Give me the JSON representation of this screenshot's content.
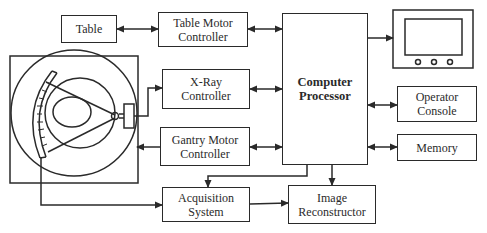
{
  "diagram": {
    "type": "CT scanner system block diagram",
    "blocks": {
      "table": {
        "label": "Table"
      },
      "table_motor": {
        "label": "Table Motor\nController"
      },
      "xray": {
        "label": "X-Ray\nController"
      },
      "gantry_motor": {
        "label": "Gantry Motor\nController"
      },
      "computer": {
        "label": "Computer\nProcessor"
      },
      "operator": {
        "label": "Operator\nConsole"
      },
      "memory": {
        "label": "Memory"
      },
      "acquisition": {
        "label": "Acquisition\nSystem"
      },
      "reconstructor": {
        "label": "Image\nReconstructor"
      }
    },
    "icons": {
      "gantry": "ct-gantry-icon",
      "monitor": "display-monitor-icon"
    },
    "connections": [
      {
        "from": "Table",
        "to": "Table Motor Controller",
        "type": "bidirectional"
      },
      {
        "from": "Table Motor Controller",
        "to": "Computer Processor",
        "type": "bidirectional"
      },
      {
        "from": "X-Ray Controller",
        "to": "Computer Processor",
        "type": "bidirectional"
      },
      {
        "from": "Gantry Motor Controller",
        "to": "Computer Processor",
        "type": "bidirectional"
      },
      {
        "from": "Gantry (X-ray tube)",
        "to": "X-Ray Controller",
        "type": "arrow"
      },
      {
        "from": "Gantry Motor Controller",
        "to": "Gantry",
        "type": "arrow"
      },
      {
        "from": "Gantry (detector)",
        "to": "Acquisition System",
        "type": "arrow"
      },
      {
        "from": "Computer Processor",
        "to": "Acquisition System",
        "type": "arrow"
      },
      {
        "from": "Acquisition System",
        "to": "Image Reconstructor",
        "type": "arrow"
      },
      {
        "from": "Computer Processor",
        "to": "Image Reconstructor",
        "type": "arrow"
      },
      {
        "from": "Computer Processor",
        "to": "Monitor",
        "type": "arrow"
      },
      {
        "from": "Computer Processor",
        "to": "Operator Console",
        "type": "bidirectional"
      },
      {
        "from": "Computer Processor",
        "to": "Memory",
        "type": "bidirectional"
      }
    ],
    "colors": {
      "line": "#2a2a2a",
      "background": "#ffffff"
    }
  }
}
